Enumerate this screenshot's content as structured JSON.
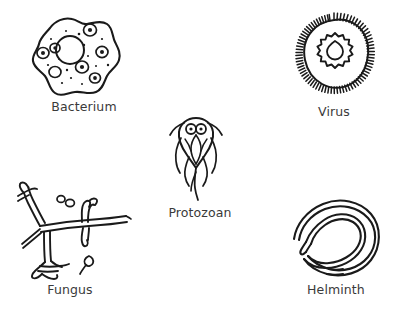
{
  "figure": {
    "style": "hand-drawn line illustration",
    "background_color": "#ffffff",
    "ink_color": "#1a1a1a",
    "label_color": "#3a3a3a",
    "width": 395,
    "height": 314
  },
  "organisms": [
    {
      "id": "bacterium",
      "label": "Bacterium",
      "description": "irregular rounded cell outline with large central vacuole, several ring-shaped granules and scattered dots",
      "label_position": "below"
    },
    {
      "id": "virus",
      "label": "Virus",
      "description": "round envelope covered in dense radiating spikes surrounding a cog-shaped capsid with a teardrop core",
      "label_position": "below"
    },
    {
      "id": "protozoan",
      "label": "Protozoan",
      "description": "teardrop body with two round nuclei and several long trailing flagella",
      "label_position": "below"
    },
    {
      "id": "fungus",
      "label": "Fungus",
      "description": "branching double-walled hyphae crossing at a central junction with small round spores nearby",
      "label_position": "below"
    },
    {
      "id": "helminth",
      "label": "Helminth",
      "description": "long worm coiled into a loose spiral with a tapered pointed head",
      "label_position": "below"
    }
  ]
}
